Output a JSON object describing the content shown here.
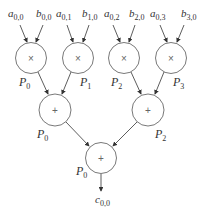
{
  "diagram": {
    "inputs": [
      {
        "var": "a",
        "sub": "0,0"
      },
      {
        "var": "b",
        "sub": "0,0"
      },
      {
        "var": "a",
        "sub": "0,1"
      },
      {
        "var": "b",
        "sub": "1,0"
      },
      {
        "var": "a",
        "sub": "0,2"
      },
      {
        "var": "b",
        "sub": "2,0"
      },
      {
        "var": "a",
        "sub": "0,3"
      },
      {
        "var": "b",
        "sub": "3,0"
      }
    ],
    "multiply_nodes": [
      {
        "op": "×",
        "label": "P",
        "sub": "0"
      },
      {
        "op": "×",
        "label": "P",
        "sub": "1"
      },
      {
        "op": "×",
        "label": "P",
        "sub": "2"
      },
      {
        "op": "×",
        "label": "P",
        "sub": "3"
      }
    ],
    "add_nodes_level1": [
      {
        "op": "+",
        "label": "P",
        "sub": "0"
      },
      {
        "op": "+",
        "label": "P",
        "sub": "2"
      }
    ],
    "add_node_root": {
      "op": "+",
      "label": "P",
      "sub": "0"
    },
    "output": {
      "var": "c",
      "sub": "0,0"
    }
  }
}
